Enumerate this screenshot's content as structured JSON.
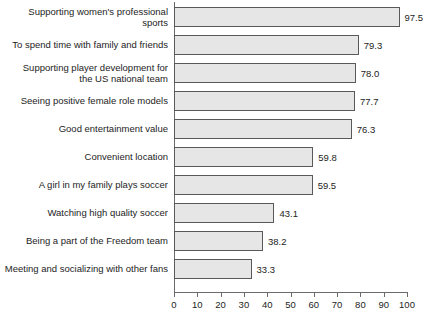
{
  "chart_data": {
    "type": "bar",
    "orientation": "horizontal",
    "title": "",
    "subtitle": "",
    "xlabel": "",
    "ylabel": "",
    "xlim": [
      0,
      100
    ],
    "xticks": [
      0,
      10,
      20,
      30,
      40,
      50,
      60,
      70,
      80,
      90,
      100
    ],
    "xtick_labels": [
      "0",
      "10",
      "20",
      "30",
      "40",
      "50",
      "60",
      "70",
      "80",
      "90",
      "100"
    ],
    "grid": false,
    "legend": null,
    "categories": [
      "Supporting women's professional sports",
      "To spend time with family and friends",
      "Supporting player development for\nthe US national team",
      "Seeing positive female role models",
      "Good entertainment value",
      "Convenient location",
      "A girl in my family plays soccer",
      "Watching high quality soccer",
      "Being a part of the Freedom team",
      "Meeting and socializing with other fans"
    ],
    "values": [
      97.5,
      79.3,
      78.0,
      77.7,
      76.3,
      59.8,
      59.5,
      43.1,
      38.2,
      33.3
    ],
    "value_labels": [
      "97.5",
      "79.3",
      "78.0",
      "77.7",
      "76.3",
      "59.8",
      "59.5",
      "43.1",
      "38.2",
      "33.3"
    ],
    "colors": {
      "bar_fill": "#e6e6e6",
      "bar_edge": "#595959",
      "axis": "#6b6b6b",
      "text": "#1d1d1d",
      "background": "#ffffff"
    }
  }
}
